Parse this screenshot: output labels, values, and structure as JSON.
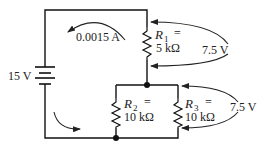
{
  "diagram": {
    "type": "circuit",
    "source": {
      "label": "15 V"
    },
    "current": {
      "label": "0.0015 A"
    },
    "resistors": [
      {
        "id": "R1",
        "name": "R",
        "sub": "1",
        "eq": "=",
        "value": "5 kΩ"
      },
      {
        "id": "R2",
        "name": "R",
        "sub": "2",
        "eq": "=",
        "value": "10 kΩ"
      },
      {
        "id": "R3",
        "name": "R",
        "sub": "3",
        "eq": "=",
        "value": "10 kΩ"
      }
    ],
    "voltage_drops": [
      {
        "across": "R1",
        "label": "7.5 V"
      },
      {
        "across": "R2||R3",
        "label": "7.5 V"
      }
    ]
  }
}
